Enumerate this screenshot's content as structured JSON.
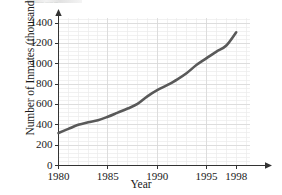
{
  "artifact": {
    "top_clipped_text": "— ——— —— —"
  },
  "chart_data": {
    "type": "line",
    "title": "",
    "xlabel": "Year",
    "ylabel": "Number of Inmates (thousands)",
    "xlim": [
      1980,
      1999.6
    ],
    "ylim": [
      0,
      1460
    ],
    "grid": true,
    "minor_grid": true,
    "legend": "none",
    "x_ticks": [
      1980,
      1985,
      1990,
      1995,
      1998
    ],
    "x_tick_labels": [
      "1980",
      "1985",
      "1990",
      "1995",
      "1998"
    ],
    "y_ticks": [
      0,
      200,
      400,
      600,
      800,
      1000,
      1200,
      1400
    ],
    "y_tick_labels": [
      "0",
      "200",
      "400",
      "600",
      "800",
      "1000",
      "1200",
      "1400"
    ],
    "series": [
      {
        "name": "Number of Inmates",
        "color": "#595959",
        "linewidth": 2.6,
        "x": [
          1980,
          1981,
          1982,
          1983,
          1984,
          1985,
          1986,
          1987,
          1988,
          1989,
          1990,
          1991,
          1992,
          1993,
          1994,
          1995,
          1996,
          1997,
          1998
        ],
        "y": [
          320,
          360,
          400,
          425,
          445,
          480,
          520,
          560,
          605,
          680,
          740,
          790,
          845,
          910,
          990,
          1055,
          1120,
          1180,
          1310
        ]
      }
    ]
  }
}
